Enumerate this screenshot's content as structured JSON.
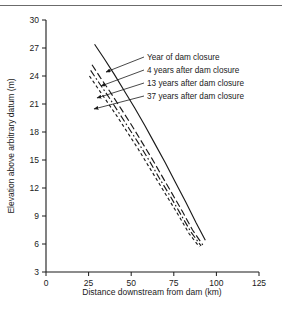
{
  "figure": {
    "background": "#ffffff",
    "ink": "#1a1a1a",
    "top_rule": true
  },
  "chart_data": {
    "type": "line",
    "title": "",
    "xlabel": "Distance downstream from dam (km)",
    "ylabel": "Elevation above arbitrary datum (m)",
    "xlim": [
      0,
      125
    ],
    "ylim": [
      3,
      30
    ],
    "xticks": [
      0,
      25,
      50,
      75,
      100,
      125
    ],
    "yticks": [
      3,
      6,
      9,
      12,
      15,
      18,
      21,
      24,
      27,
      30
    ],
    "xticklabels": [
      "0",
      "25",
      "50",
      "75",
      "100",
      "125"
    ],
    "yticklabels": [
      "3",
      "6",
      "9",
      "12",
      "15",
      "18",
      "21",
      "24",
      "27",
      "30"
    ],
    "grid": false,
    "legend_position": "inside-upper-right-with-leader-arrows",
    "series": [
      {
        "name": "Year of dam closure",
        "style": "solid",
        "x": [
          28.5,
          34,
          40,
          46,
          52,
          58,
          64,
          70,
          76,
          82,
          88,
          93.5
        ],
        "y": [
          27.4,
          25.9,
          24.2,
          22.4,
          20.6,
          18.7,
          16.7,
          14.7,
          12.6,
          10.5,
          8.3,
          6.4
        ]
      },
      {
        "name": "4 years after dam closure",
        "style": "long-dash",
        "x": [
          27.0,
          32,
          38,
          44,
          50,
          56,
          62,
          68,
          74,
          80,
          86,
          92.0
        ],
        "y": [
          25.2,
          23.8,
          22.2,
          20.5,
          18.8,
          17.0,
          15.2,
          13.3,
          11.4,
          9.5,
          7.5,
          5.9
        ]
      },
      {
        "name": "13 years after dam closure",
        "style": "dash-dot",
        "x": [
          26.2,
          31,
          37,
          43,
          49,
          55,
          61,
          67,
          73,
          79,
          85,
          91.0
        ],
        "y": [
          24.6,
          23.3,
          21.7,
          20.0,
          18.3,
          16.6,
          14.8,
          12.9,
          11.1,
          9.2,
          7.3,
          5.8
        ]
      },
      {
        "name": "37 years after dam closure",
        "style": "short-dash",
        "x": [
          25.5,
          30,
          36,
          42,
          48,
          54,
          60,
          66,
          72,
          78,
          84,
          90.0
        ],
        "y": [
          24.0,
          22.8,
          21.2,
          19.6,
          17.9,
          16.2,
          14.4,
          12.6,
          10.8,
          9.0,
          7.1,
          5.7
        ]
      }
    ],
    "annotations": [
      {
        "label": "Year of dam closure",
        "text_x": 147,
        "text_y": 60,
        "arrow_x": 106,
        "arrow_y": 72
      },
      {
        "label": "4 years after dam closure",
        "text_x": 147,
        "text_y": 73,
        "arrow_x": 101,
        "arrow_y": 86
      },
      {
        "label": "13 years after dam closure",
        "text_x": 147,
        "text_y": 86,
        "arrow_x": 97,
        "arrow_y": 98
      },
      {
        "label": "37 years after dam closure",
        "text_x": 147,
        "text_y": 99,
        "arrow_x": 94,
        "arrow_y": 109
      }
    ]
  }
}
